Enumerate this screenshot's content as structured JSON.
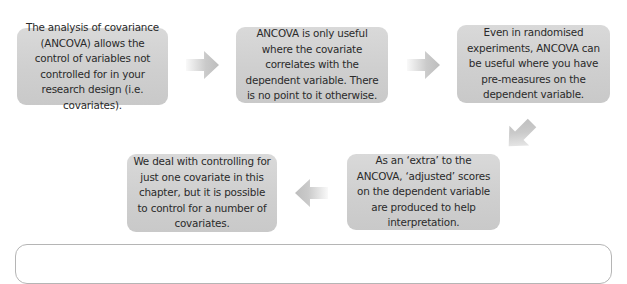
{
  "diagram": {
    "type": "flow",
    "colors": {
      "box_fill": "#d0d0d0",
      "box_text": "#2a2a2a",
      "arrow": "#c4c4c4",
      "panel_border": "#b5b5b5"
    },
    "steps": [
      {
        "id": 1,
        "text": "The analysis of covariance (ANCOVA) allows the control of variables not controlled for in your research design (i.e. covariates)."
      },
      {
        "id": 2,
        "text": "ANCOVA is only useful where the covariate correlates with the dependent variable. There is no point to it otherwise."
      },
      {
        "id": 3,
        "text": "Even in randomised experiments, ANCOVA can be useful where you have pre-measures on the dependent variable."
      },
      {
        "id": 4,
        "text": "As an ‘extra’ to the ANCOVA, ‘adjusted’ scores on the dependent variable are produced to help interpretation."
      },
      {
        "id": 5,
        "text": "We deal with controlling for just one covariate in this chapter, but it is possible to control for a number of covariates."
      }
    ],
    "arrows": [
      {
        "from": 1,
        "to": 2,
        "direction": "right"
      },
      {
        "from": 2,
        "to": 3,
        "direction": "right"
      },
      {
        "from": 3,
        "to": 4,
        "direction": "down-left"
      },
      {
        "from": 4,
        "to": 5,
        "direction": "left"
      }
    ]
  }
}
